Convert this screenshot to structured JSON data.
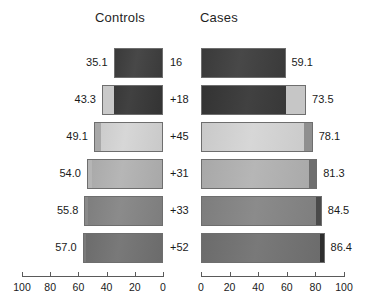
{
  "headers": {
    "left": "Controls",
    "right": "Cases"
  },
  "chart_data": {
    "type": "bar",
    "title": "",
    "subtitle": "",
    "orientation": "horizontal-mirrored",
    "xlabel": "",
    "ylabel": "",
    "grid": false,
    "legend_position": "none",
    "panels": [
      {
        "name": "Controls",
        "axis_label": "Controls",
        "direction": "right-to-left",
        "xlim": [
          0,
          100
        ],
        "ticks": [
          100,
          80,
          60,
          40,
          20,
          0
        ],
        "tick_labels": [
          "100",
          "80",
          "60",
          "40",
          "20",
          "0"
        ],
        "values": [
          35.1,
          43.3,
          49.1,
          54.0,
          55.8,
          57.0
        ],
        "value_labels": [
          "35.1",
          "43.3",
          "49.1",
          "54.0",
          "55.8",
          "57.0"
        ],
        "increments": [
          35.1,
          8.2,
          5.8,
          4.9,
          1.8,
          1.2
        ]
      },
      {
        "name": "Cases",
        "axis_label": "Cases",
        "direction": "left-to-right",
        "xlim": [
          0,
          100
        ],
        "ticks": [
          0,
          20,
          40,
          60,
          80,
          100
        ],
        "tick_labels": [
          "0",
          "20",
          "40",
          "60",
          "80",
          "100"
        ],
        "values": [
          59.1,
          73.5,
          78.1,
          81.3,
          84.5,
          86.4
        ],
        "value_labels": [
          "59.1",
          "73.5",
          "78.1",
          "81.3",
          "84.5",
          "86.4"
        ],
        "increments": [
          59.1,
          14.4,
          4.6,
          3.2,
          3.2,
          1.9
        ]
      }
    ],
    "center_labels": [
      "16",
      "+18",
      "+45",
      "+31",
      "+33",
      "+52"
    ],
    "rows": [
      {
        "index": 0,
        "control_value": "35.1",
        "center_label": "16",
        "case_value": "59.1",
        "control_main_color": "#3a3a3a",
        "control_seg_color": "#3a3a3a",
        "case_main_color": "#3a3a3a",
        "case_seg_color": "#3a3a3a",
        "control_seg_pct": 0,
        "case_seg_pct": 0
      },
      {
        "index": 1,
        "control_value": "43.3",
        "center_label": "+18",
        "case_value": "73.5",
        "control_main_color": "#333333",
        "control_seg_color": "#c9c9c9",
        "case_main_color": "#333333",
        "case_seg_color": "#c6c6c6",
        "control_seg_pct": 19,
        "case_seg_pct": 19
      },
      {
        "index": 2,
        "control_value": "49.1",
        "center_label": "+45",
        "case_value": "78.1",
        "control_main_color": "#c9c9c9",
        "control_seg_color": "#a8a8a8",
        "case_main_color": "#c9c9c9",
        "case_seg_color": "#8f8f8f",
        "control_seg_pct": 10,
        "case_seg_pct": 7
      },
      {
        "index": 3,
        "control_value": "54.0",
        "center_label": "+31",
        "case_value": "81.3",
        "control_main_color": "#a8a8a8",
        "control_seg_color": "#b5b5b5",
        "case_main_color": "#a8a8a8",
        "case_seg_color": "#6e6e6e",
        "control_seg_pct": 6,
        "case_seg_pct": 6
      },
      {
        "index": 4,
        "control_value": "55.8",
        "center_label": "+33",
        "case_value": "84.5",
        "control_main_color": "#7d7d7d",
        "control_seg_color": "#8a8a8a",
        "case_main_color": "#7d7d7d",
        "case_seg_color": "#4a4a4a",
        "control_seg_pct": 4,
        "case_seg_pct": 4
      },
      {
        "index": 5,
        "control_value": "57.0",
        "center_label": "+52",
        "case_value": "86.4",
        "control_main_color": "#6b6b6b",
        "control_seg_color": "#7a7a7a",
        "case_main_color": "#6b6b6b",
        "case_seg_color": "#2e2e2e",
        "control_seg_pct": 3,
        "case_seg_pct": 3
      }
    ]
  },
  "geometry": {
    "left_axis_x0": 22,
    "left_axis_x1": 163,
    "right_axis_x0": 201,
    "right_axis_x1": 344,
    "axis_y": 276,
    "row_tops": [
      48,
      85,
      122,
      159,
      196,
      233
    ],
    "row_height": 30
  }
}
